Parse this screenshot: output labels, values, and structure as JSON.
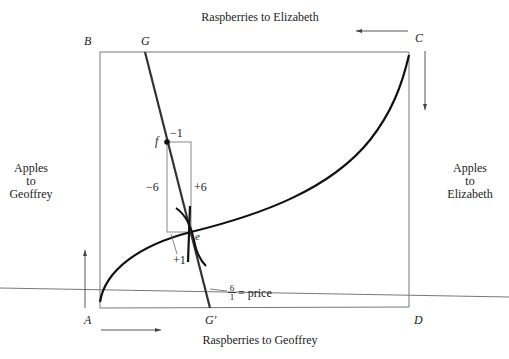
{
  "diagram": {
    "type": "edgeworth_box",
    "top_axis_label": "Raspberries to Elizabeth",
    "bottom_axis_label": "Raspberries to Geoffrey",
    "left_axis_label": [
      "Apples",
      "to",
      "Geoffrey"
    ],
    "right_axis_label": [
      "Apples",
      "to",
      "Elizabeth"
    ],
    "corners": {
      "top_left": "B",
      "top_right": "C",
      "bottom_left": "A",
      "bottom_right": "D"
    },
    "line_labels": {
      "top": "G",
      "bottom": "G′"
    },
    "points": {
      "f": "f",
      "e": "e"
    },
    "box_labels": {
      "top": "−1",
      "left": "−6",
      "right": "+6",
      "bottom": "+1"
    },
    "price_label": {
      "numerator": "6",
      "denominator": "1",
      "text": "= price"
    },
    "colors": {
      "curve": "#111111",
      "box": "#777777",
      "line": "#333333"
    }
  }
}
